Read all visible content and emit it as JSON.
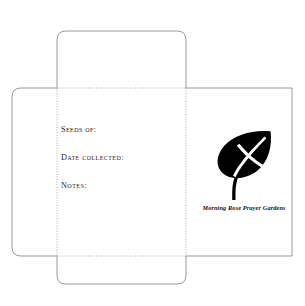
{
  "document": {
    "type": "seed-envelope-die-cut-template",
    "background_color": "#ffffff",
    "cut_line_color": "#808080",
    "fold_line_color": "#999999",
    "ink_color": "#1c1c1c"
  },
  "panels": {
    "top_flap": "",
    "left_flap": "",
    "front_panel": "",
    "back_panel": "",
    "bottom_flap": ""
  },
  "fields": [
    {
      "label": "Seeds of:"
    },
    {
      "label": "Date collected:"
    },
    {
      "label": "Notes:"
    }
  ],
  "brand": {
    "logo_icon": "leaf-with-cross-icon",
    "logo_color": "#000000",
    "cross_color": "#ffffff",
    "name": "Morning Rose Prayer Gardens"
  }
}
